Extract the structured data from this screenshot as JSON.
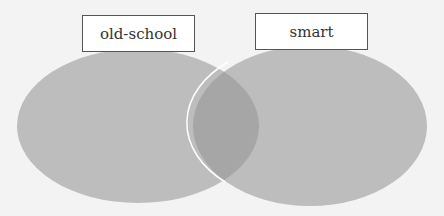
{
  "diagram": {
    "type": "venn",
    "sets": [
      {
        "label": "old-school",
        "fill": "#bdbdbd"
      },
      {
        "label": "smart",
        "fill": "#bdbdbd"
      }
    ],
    "overlap_fill": "#a6a6a6",
    "outline_color": "#ffffff",
    "background": "#f3f3f3"
  }
}
